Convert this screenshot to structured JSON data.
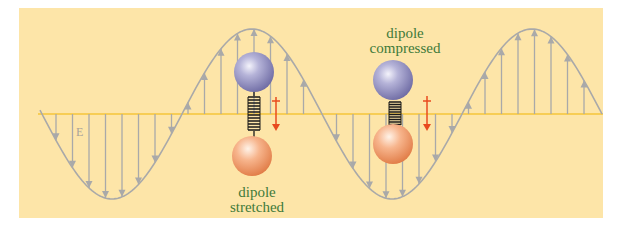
{
  "diagram": {
    "background_color": "#fde5a8",
    "axis_color": "#f5c53a",
    "wave_color": "#a9a9a9",
    "field_label": "E",
    "dipoles": [
      {
        "label_line1": "dipole",
        "label_line2": "stretched",
        "top_sphere_color": "#9a97c4",
        "bottom_sphere_color": "#f3a275",
        "force_arrow_color": "#e84a1f"
      },
      {
        "label_line1": "dipole",
        "label_line2": "compressed",
        "top_sphere_color": "#9a97c4",
        "bottom_sphere_color": "#f3a275",
        "force_arrow_color": "#e84a1f"
      }
    ]
  }
}
